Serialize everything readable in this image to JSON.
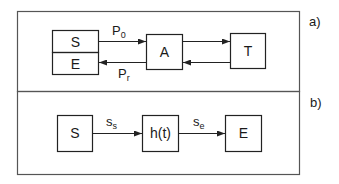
{
  "panels": [
    {
      "label": "a)",
      "boxes": {
        "source": "S",
        "emitter": "E",
        "agent": "A",
        "target": "T"
      },
      "arrows": {
        "forward": {
          "symbol": "P",
          "subscript": "0"
        },
        "return": {
          "symbol": "P",
          "subscript": "r"
        }
      }
    },
    {
      "label": "b)",
      "boxes": {
        "source": "S",
        "filter": "h(t)",
        "end": "E"
      },
      "arrows": {
        "input": {
          "symbol": "s",
          "subscript": "s"
        },
        "output": {
          "symbol": "s",
          "subscript": "e"
        }
      }
    }
  ],
  "colors": {
    "stroke": "#2a2a2a",
    "frame": "#555555"
  }
}
